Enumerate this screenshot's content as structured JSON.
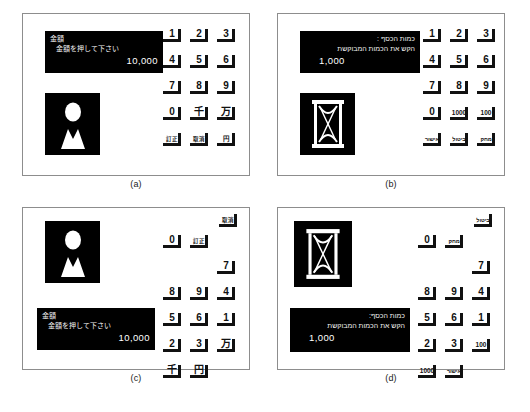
{
  "figure": {
    "background": "#ffffff",
    "border_color": "#8d8d8d",
    "display_bg": "#000000",
    "display_fg": "#ffffff",
    "key_color": "#111111"
  },
  "captions": {
    "a": "(a)",
    "b": "(b)",
    "c": "(c)",
    "d": "(d)"
  },
  "panels": {
    "a": {
      "language": "japanese",
      "display": {
        "title": "金額",
        "prompt": "金額を押して下さい",
        "amount": "10,000",
        "align": "left"
      },
      "icon": "person-bust-icon",
      "keys": [
        {
          "label": "1",
          "size": "big"
        },
        {
          "label": "2",
          "size": "big"
        },
        {
          "label": "3",
          "size": "big"
        },
        {
          "label": "4",
          "size": "big"
        },
        {
          "label": "5",
          "size": "big"
        },
        {
          "label": "6",
          "size": "big"
        },
        {
          "label": "7",
          "size": "big"
        },
        {
          "label": "8",
          "size": "big"
        },
        {
          "label": "9",
          "size": "big"
        },
        {
          "label": "0",
          "size": "big"
        },
        {
          "label": "千",
          "size": "big"
        },
        {
          "label": "万",
          "size": "big"
        },
        {
          "label": "訂正",
          "size": "small"
        },
        {
          "label": "取消",
          "size": "small"
        },
        {
          "label": "円",
          "size": "mid"
        }
      ]
    },
    "b": {
      "language": "hebrew",
      "display": {
        "title": "כמות הכסף :",
        "prompt": "הקש את הכמות המבוקשת",
        "amount": "1,000",
        "align": "right"
      },
      "icon": "hourglass-icon",
      "keys": [
        {
          "label": "1",
          "size": "big"
        },
        {
          "label": "2",
          "size": "big"
        },
        {
          "label": "3",
          "size": "big"
        },
        {
          "label": "4",
          "size": "big"
        },
        {
          "label": "5",
          "size": "big"
        },
        {
          "label": "6",
          "size": "big"
        },
        {
          "label": "7",
          "size": "big"
        },
        {
          "label": "8",
          "size": "big"
        },
        {
          "label": "9",
          "size": "big"
        },
        {
          "label": "0",
          "size": "big"
        },
        {
          "label": "1000",
          "size": "mid"
        },
        {
          "label": "100",
          "size": "mid"
        },
        {
          "label": "אישור",
          "size": "small"
        },
        {
          "label": "ביטול",
          "size": "small"
        },
        {
          "label": "מחק",
          "size": "small"
        }
      ]
    },
    "c": {
      "language": "japanese",
      "display": {
        "title": "金額",
        "prompt": "金額を押して下さい",
        "amount": "10,000",
        "align": "left"
      },
      "icon": "person-bust-icon",
      "keys": [
        {
          "label": "0",
          "size": "big"
        },
        {
          "label": "訂正",
          "size": "small"
        },
        {
          "label": "取消",
          "size": "small"
        },
        {
          "label": "7",
          "size": "big"
        },
        {
          "label": "8",
          "size": "big"
        },
        {
          "label": "9",
          "size": "big"
        },
        {
          "label": "4",
          "size": "big"
        },
        {
          "label": "5",
          "size": "big"
        },
        {
          "label": "6",
          "size": "big"
        },
        {
          "label": "1",
          "size": "big"
        },
        {
          "label": "2",
          "size": "big"
        },
        {
          "label": "3",
          "size": "big"
        },
        {
          "label": "万",
          "size": "big"
        },
        {
          "label": "千",
          "size": "big"
        },
        {
          "label": "円",
          "size": "big"
        }
      ]
    },
    "d": {
      "language": "hebrew",
      "display": {
        "title": "כמות הכסף:",
        "prompt": "הקש את הכמות המבוקשת",
        "amount": "1,000",
        "align": "right"
      },
      "icon": "hourglass-icon",
      "keys": [
        {
          "label": "0",
          "size": "big"
        },
        {
          "label": "מחק",
          "size": "small"
        },
        {
          "label": "ביטול",
          "size": "small"
        },
        {
          "label": "7",
          "size": "big"
        },
        {
          "label": "8",
          "size": "big"
        },
        {
          "label": "9",
          "size": "big"
        },
        {
          "label": "4",
          "size": "big"
        },
        {
          "label": "5",
          "size": "big"
        },
        {
          "label": "6",
          "size": "big"
        },
        {
          "label": "1",
          "size": "big"
        },
        {
          "label": "2",
          "size": "big"
        },
        {
          "label": "3",
          "size": "big"
        },
        {
          "label": "100",
          "size": "mid"
        },
        {
          "label": "1000",
          "size": "mid"
        },
        {
          "label": "אישור",
          "size": "small"
        }
      ]
    }
  }
}
